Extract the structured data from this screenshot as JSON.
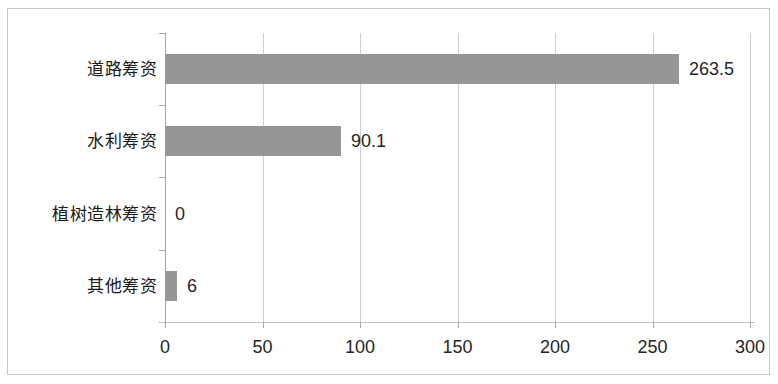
{
  "chart_data": {
    "type": "bar",
    "orientation": "horizontal",
    "title": "",
    "xlabel": "",
    "ylabel": "",
    "categories": [
      "道路筹资",
      "水利筹资",
      "植树造林筹资",
      "其他筹资"
    ],
    "values": [
      263.5,
      90.1,
      0,
      6
    ],
    "value_labels": [
      "263.5",
      "90.1",
      "0",
      "6"
    ],
    "xlim": [
      0,
      300
    ],
    "xticks": [
      0,
      50,
      100,
      150,
      200,
      250,
      300
    ],
    "xtick_labels": [
      "0",
      "50",
      "100",
      "150",
      "200",
      "250",
      "300"
    ],
    "grid": true,
    "grid_axis": "x",
    "legend": false,
    "legend_position": "none",
    "series": [
      {
        "name": "",
        "color": "#969696",
        "values": [
          263.5,
          90.1,
          0,
          6
        ]
      }
    ]
  },
  "colors": {
    "bar": "#969696",
    "gridline": "#cfcfcf",
    "axis": "#a6a6a6",
    "border": "#c8c8c8",
    "background": "#ffffff",
    "text": "#262626"
  }
}
